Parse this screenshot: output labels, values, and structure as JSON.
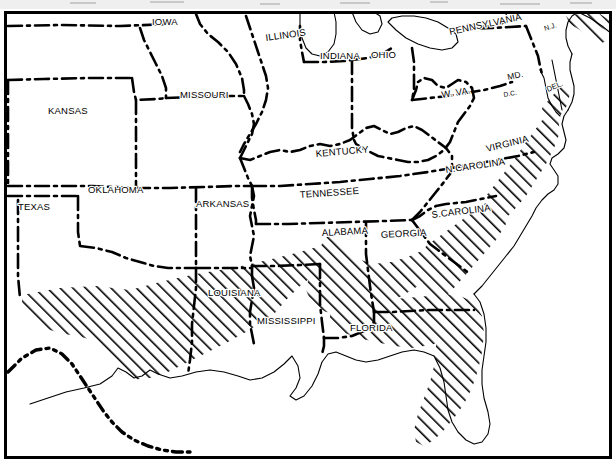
{
  "map": {
    "title": "Southeastern United States Distribution Map",
    "description": "Black and white line map of the eastern and central United States with dash-dot state boundaries and a diagonally hatched shaded region covering the Gulf Coastal Plain and Atlantic Coastal Plain.",
    "projection_note": "Plate-like regional outline, no graticule shown",
    "colors": {
      "background": "#ffffff",
      "ink": "#000000",
      "frame": "#000000",
      "hatch": "#000000",
      "label_halo": "#ffffff",
      "top_artifact": "#9a9a9a"
    },
    "frame": {
      "visible": true,
      "stroke_width_px": 3
    },
    "legend": {
      "visible": false,
      "hatch_meaning": "shaded distribution area"
    },
    "line_styles": {
      "state_boundary": "dash-dot",
      "international_boundary": "dash-dot-dot",
      "coastline": "thin solid",
      "lake_shore": "thin solid"
    },
    "labels": [
      {
        "id": "iowa",
        "text": "IOWA",
        "x": 152,
        "y": 25,
        "rotate": 0,
        "size": 9.5
      },
      {
        "id": "illinois",
        "text": "ILLINOIS",
        "x": 266,
        "y": 41,
        "rotate": -8,
        "size": 9.5
      },
      {
        "id": "indiana",
        "text": "INDIANA",
        "x": 320,
        "y": 59,
        "rotate": 0,
        "size": 9.5
      },
      {
        "id": "ohio",
        "text": "OHIO",
        "x": 371,
        "y": 58,
        "rotate": 0,
        "size": 9.5
      },
      {
        "id": "pennsylvania",
        "text": "PENNSYLVANIA",
        "x": 450,
        "y": 35,
        "rotate": -12,
        "size": 9.5
      },
      {
        "id": "new-jersey",
        "text": "N.J.",
        "x": 545,
        "y": 31,
        "rotate": -18,
        "size": 7.0
      },
      {
        "id": "missouri",
        "text": "MISSOURI",
        "x": 180,
        "y": 98,
        "rotate": 0,
        "size": 9.5
      },
      {
        "id": "kansas",
        "text": "KANSAS",
        "x": 48,
        "y": 114,
        "rotate": 0,
        "size": 9.5
      },
      {
        "id": "west-virginia",
        "text": "W. VA.",
        "x": 442,
        "y": 98,
        "rotate": -9,
        "size": 9.5
      },
      {
        "id": "maryland",
        "text": "MD.",
        "x": 508,
        "y": 80,
        "rotate": -12,
        "size": 8.5
      },
      {
        "id": "dc",
        "text": "D.C.",
        "x": 504,
        "y": 97,
        "rotate": -10,
        "size": 6.5
      },
      {
        "id": "delaware",
        "text": "DEL.",
        "x": 548,
        "y": 92,
        "rotate": -24,
        "size": 7.5
      },
      {
        "id": "kentucky",
        "text": "KENTUCKY",
        "x": 316,
        "y": 157,
        "rotate": -5,
        "size": 9.5
      },
      {
        "id": "virginia",
        "text": "VIRGINIA",
        "x": 487,
        "y": 152,
        "rotate": -14,
        "size": 9.5
      },
      {
        "id": "north-carolina",
        "text": "N.CAROLINA",
        "x": 446,
        "y": 173,
        "rotate": -8,
        "size": 9.5
      },
      {
        "id": "tennessee",
        "text": "TENNESSEE",
        "x": 300,
        "y": 198,
        "rotate": -4,
        "size": 9.5
      },
      {
        "id": "oklahoma",
        "text": "OKLAHOMA",
        "x": 88,
        "y": 193,
        "rotate": 0,
        "size": 9.5
      },
      {
        "id": "arkansas",
        "text": "ARKANSAS",
        "x": 196,
        "y": 207,
        "rotate": 0,
        "size": 9.5
      },
      {
        "id": "texas",
        "text": "TEXAS",
        "x": 18,
        "y": 210,
        "rotate": 0,
        "size": 9.5
      },
      {
        "id": "south-carolina",
        "text": "S.CAROLINA",
        "x": 432,
        "y": 218,
        "rotate": -7,
        "size": 9.5
      },
      {
        "id": "alabama",
        "text": "ALABAMA",
        "x": 322,
        "y": 236,
        "rotate": -3,
        "size": 9.5
      },
      {
        "id": "georgia",
        "text": "GEORGIA",
        "x": 381,
        "y": 238,
        "rotate": -3,
        "size": 9.5
      },
      {
        "id": "louisiana",
        "text": "LOUISIANA",
        "x": 208,
        "y": 296,
        "rotate": 0,
        "size": 9.5
      },
      {
        "id": "mississippi",
        "text": "MISSISSIPPI",
        "x": 257,
        "y": 324,
        "rotate": 0,
        "size": 9.5
      },
      {
        "id": "florida",
        "text": "FLORIDA",
        "x": 350,
        "y": 331,
        "rotate": 0,
        "size": 9.5
      }
    ],
    "hatched_regions": [
      {
        "id": "gulf-atlantic-coastal-plain",
        "name": "Gulf and Atlantic Coastal Plain shaded area"
      },
      {
        "id": "florida-peninsula",
        "name": "Florida peninsula shaded area"
      },
      {
        "id": "carolina-virginia-coast",
        "name": "Carolina and Virginia coastal shaded area"
      },
      {
        "id": "new-jersey-coast",
        "name": "New Jersey coastal shaded area"
      }
    ]
  }
}
